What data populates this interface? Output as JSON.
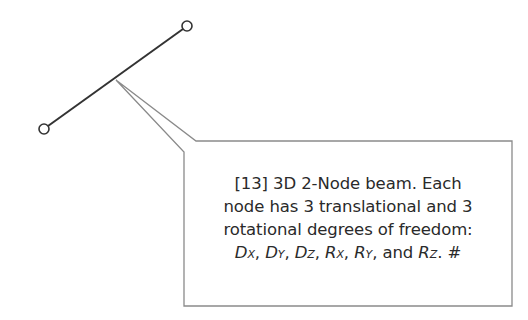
{
  "diagram": {
    "type": "finite-element-beam-callout",
    "beam": {
      "node_a": {
        "x": 44,
        "y": 129
      },
      "node_b": {
        "x": 187,
        "y": 26
      },
      "node_radius": 5,
      "color": "#333333"
    },
    "callout": {
      "pointer_apex": {
        "x": 116,
        "y": 80
      },
      "box": {
        "left": 184,
        "top": 141,
        "right": 512,
        "bottom": 306
      },
      "border_color": "#8a8a8a",
      "lines": [
        "[13] 3D 2-Node beam.  Each",
        "node has 3 translational and 3",
        "rotational degrees of freedom:"
      ],
      "dof_line": {
        "items": [
          {
            "base": "D",
            "sub": "X"
          },
          {
            "base": "D",
            "sub": "Y"
          },
          {
            "base": "D",
            "sub": "Z"
          },
          {
            "base": "R",
            "sub": "X"
          },
          {
            "base": "R",
            "sub": "Y"
          },
          {
            "base": "R",
            "sub": "Z"
          }
        ],
        "sep": ", ",
        "conjunction": "and",
        "suffix": ".  #"
      }
    }
  }
}
